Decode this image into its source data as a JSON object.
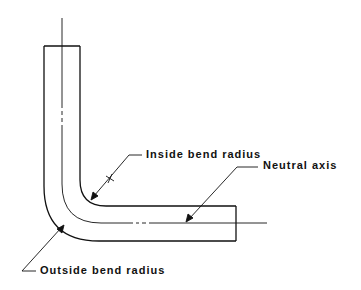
{
  "diagram": {
    "type": "bent-tube-cross-section",
    "labels": {
      "inside_bend_radius": "Inside bend radius",
      "neutral_axis": "Neutral axis",
      "outside_bend_radius": "Outside bend radius"
    },
    "colors": {
      "stroke": "#111111",
      "background": "#ffffff"
    }
  }
}
